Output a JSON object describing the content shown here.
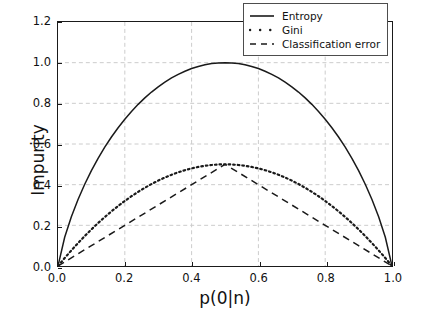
{
  "chart_data": {
    "type": "line",
    "title": "",
    "xlabel": "p(0|n)",
    "ylabel": "Impurity",
    "xlim": [
      0.0,
      1.0
    ],
    "ylim": [
      0.0,
      1.2
    ],
    "xticks": [
      "0.0",
      "0.2",
      "0.4",
      "0.6",
      "0.8",
      "1.0"
    ],
    "xtick_values": [
      0.0,
      0.2,
      0.4,
      0.6,
      0.8,
      1.0
    ],
    "yticks": [
      "0.0",
      "0.2",
      "0.4",
      "0.6",
      "0.8",
      "1.0",
      "1.2"
    ],
    "ytick_values": [
      0.0,
      0.2,
      0.4,
      0.6,
      0.8,
      1.0,
      1.2
    ],
    "grid": true,
    "grid_color": "#cccccc",
    "grid_style": "dashed",
    "legend_position": "upper right",
    "series": [
      {
        "name": "Entropy",
        "style": "solid",
        "color": "#1a1a1a",
        "x": [
          0.0,
          0.02,
          0.04,
          0.06,
          0.08,
          0.1,
          0.12,
          0.14,
          0.16,
          0.18,
          0.2,
          0.22,
          0.24,
          0.26,
          0.28,
          0.3,
          0.32,
          0.34,
          0.36,
          0.38,
          0.4,
          0.42,
          0.44,
          0.46,
          0.48,
          0.5,
          0.52,
          0.54,
          0.56,
          0.58,
          0.6,
          0.62,
          0.64,
          0.66,
          0.68,
          0.7,
          0.72,
          0.74,
          0.76,
          0.78,
          0.8,
          0.82,
          0.84,
          0.86,
          0.88,
          0.9,
          0.92,
          0.94,
          0.96,
          0.98,
          1.0
        ],
        "y": [
          0.0,
          0.1414,
          0.2423,
          0.3274,
          0.4022,
          0.469,
          0.5294,
          0.5842,
          0.6343,
          0.6801,
          0.7219,
          0.7602,
          0.795,
          0.8267,
          0.8555,
          0.8813,
          0.9044,
          0.9249,
          0.9427,
          0.958,
          0.971,
          0.9815,
          0.9896,
          0.9954,
          0.9988,
          1.0,
          0.9988,
          0.9954,
          0.9896,
          0.9815,
          0.971,
          0.958,
          0.9427,
          0.9249,
          0.9044,
          0.8813,
          0.8555,
          0.8267,
          0.795,
          0.7602,
          0.7219,
          0.6801,
          0.6343,
          0.5842,
          0.5294,
          0.469,
          0.4022,
          0.3274,
          0.2423,
          0.1414,
          0.0
        ]
      },
      {
        "name": "Gini",
        "style": "dotted",
        "color": "#1a1a1a",
        "x": [
          0.0,
          0.02,
          0.04,
          0.06,
          0.08,
          0.1,
          0.12,
          0.14,
          0.16,
          0.18,
          0.2,
          0.22,
          0.24,
          0.26,
          0.28,
          0.3,
          0.32,
          0.34,
          0.36,
          0.38,
          0.4,
          0.42,
          0.44,
          0.46,
          0.48,
          0.5,
          0.52,
          0.54,
          0.56,
          0.58,
          0.6,
          0.62,
          0.64,
          0.66,
          0.68,
          0.7,
          0.72,
          0.74,
          0.76,
          0.78,
          0.8,
          0.82,
          0.84,
          0.86,
          0.88,
          0.9,
          0.92,
          0.94,
          0.96,
          0.98,
          1.0
        ],
        "y": [
          0.0,
          0.0392,
          0.0768,
          0.1128,
          0.1472,
          0.18,
          0.2112,
          0.2408,
          0.2688,
          0.2952,
          0.32,
          0.3432,
          0.3648,
          0.3848,
          0.4032,
          0.42,
          0.4352,
          0.4488,
          0.4608,
          0.4712,
          0.48,
          0.4872,
          0.4928,
          0.4968,
          0.4992,
          0.5,
          0.4992,
          0.4968,
          0.4928,
          0.4872,
          0.48,
          0.4712,
          0.4608,
          0.4488,
          0.4352,
          0.42,
          0.4032,
          0.3848,
          0.3648,
          0.3432,
          0.32,
          0.2952,
          0.2688,
          0.2408,
          0.2112,
          0.18,
          0.1472,
          0.1128,
          0.0768,
          0.0392,
          0.0
        ]
      },
      {
        "name": "Classification error",
        "style": "dashed",
        "color": "#1a1a1a",
        "x": [
          0.0,
          0.1,
          0.2,
          0.3,
          0.4,
          0.5,
          0.6,
          0.7,
          0.8,
          0.9,
          1.0
        ],
        "y": [
          0.0,
          0.1,
          0.2,
          0.3,
          0.4,
          0.5,
          0.4,
          0.3,
          0.2,
          0.1,
          0.0
        ]
      }
    ]
  },
  "legend": {
    "items": [
      {
        "label": "Entropy",
        "style": "solid"
      },
      {
        "label": "Gini",
        "style": "dotted"
      },
      {
        "label": "Classification error",
        "style": "dashed"
      }
    ]
  }
}
